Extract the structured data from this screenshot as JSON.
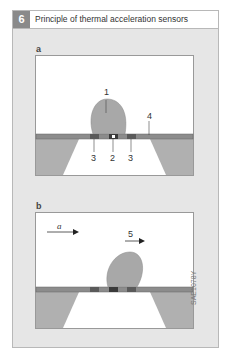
{
  "figure": {
    "number": "6",
    "title": "Principle of thermal acceleration sensors",
    "code": "SAE1078Y"
  },
  "panels": [
    {
      "label": "a",
      "callouts": [
        "1",
        "2",
        "3",
        "3",
        "4"
      ]
    },
    {
      "label": "b",
      "acceleration_symbol": "a",
      "callouts": [
        "5"
      ]
    }
  ],
  "colors": {
    "frame_bg": "#e6e6e6",
    "header_num_bg": "#8a8a8a",
    "bubble": "#a8a8a8",
    "substrate": "#b0b0b0",
    "membrane": "#8c8c8c",
    "element": "#5a5a5a"
  }
}
